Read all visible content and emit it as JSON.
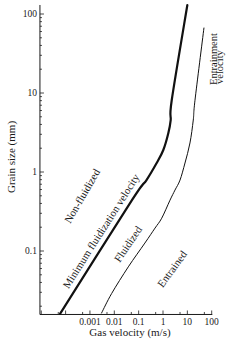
{
  "figure": {
    "x_axis_title": "Gas velocity (m/s)",
    "y_axis_title": "Grain size (mm)"
  },
  "chart_data": {
    "type": "line",
    "title": "",
    "xlabel": "Gas velocity (m/s)",
    "ylabel": "Grain size (mm)",
    "xscale": "log",
    "yscale": "log",
    "xlim": [
      1e-05,
      100
    ],
    "ylim": [
      0.016,
      130
    ],
    "grid": false,
    "legend": null,
    "x_ticks": [
      {
        "value": 0.001,
        "label": "0.001"
      },
      {
        "value": 0.01,
        "label": "0.01"
      },
      {
        "value": 0.1,
        "label": "0.1"
      },
      {
        "value": 1,
        "label": "1"
      },
      {
        "value": 10,
        "label": "10"
      },
      {
        "value": 100,
        "label": "100"
      }
    ],
    "y_ticks": [
      {
        "value": 100,
        "label": "100"
      },
      {
        "value": 10,
        "label": "10"
      },
      {
        "value": 1,
        "label": "1"
      },
      {
        "value": 0.1,
        "label": "0.1"
      }
    ],
    "series": [
      {
        "name": "Minimum fluidization velocity",
        "style": "thick",
        "color": "#111111",
        "points": [
          [
            5.9e-05,
            0.016
          ],
          [
            0.053,
            0.44
          ],
          [
            0.21,
            0.79
          ],
          [
            0.55,
            1.3
          ],
          [
            1.03,
            1.9
          ],
          [
            1.65,
            3.1
          ],
          [
            2.07,
            4.55
          ],
          [
            2.28,
            8.1
          ],
          [
            10.0,
            130
          ]
        ]
      },
      {
        "name": "Entrainment velocity",
        "style": "thin",
        "color": "#111111",
        "points": [
          [
            0.003,
            0.0164
          ],
          [
            0.0078,
            0.029
          ],
          [
            0.0376,
            0.063
          ],
          [
            0.18,
            0.126
          ],
          [
            0.47,
            0.195
          ],
          [
            0.885,
            0.26
          ],
          [
            1.94,
            0.44
          ],
          [
            3.1,
            0.59
          ],
          [
            5.0,
            0.79
          ],
          [
            8.0,
            1.3
          ],
          [
            12.8,
            2.33
          ],
          [
            17.5,
            4.55
          ],
          [
            20.6,
            8.1
          ],
          [
            48,
            66.5
          ]
        ]
      }
    ],
    "annotations": [
      {
        "text": "Non-fluidized",
        "region": "left of minimum fluidization curve"
      },
      {
        "text": "Minimum fluidization velocity",
        "region": "along thick curve"
      },
      {
        "text": "Fluidized",
        "region": "between curves"
      },
      {
        "text": "Entrained",
        "region": "right of entrainment curve"
      },
      {
        "text": "Entrainment velocity",
        "lines": [
          "Entrainment",
          "velocity"
        ],
        "region": "top of thin curve"
      }
    ]
  }
}
